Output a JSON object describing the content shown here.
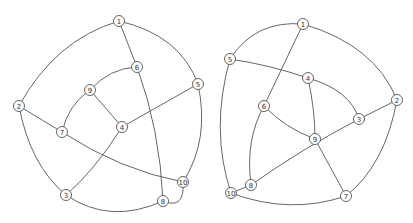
{
  "graphs": [
    {
      "name": "left-graph",
      "nodes": [
        {
          "id": "1",
          "x": 119,
          "y": 21
        },
        {
          "id": "2",
          "x": 19,
          "y": 106
        },
        {
          "id": "3",
          "x": 66,
          "y": 195
        },
        {
          "id": "4",
          "x": 122,
          "y": 127
        },
        {
          "id": "5",
          "x": 198,
          "y": 84
        },
        {
          "id": "6",
          "x": 137,
          "y": 67
        },
        {
          "id": "7",
          "x": 62,
          "y": 132
        },
        {
          "id": "8",
          "x": 163,
          "y": 201
        },
        {
          "id": "9",
          "x": 90,
          "y": 90
        },
        {
          "id": "10",
          "x": 183,
          "y": 182
        }
      ],
      "edges": [
        {
          "d": "M119,21 Q55,40 19,106"
        },
        {
          "d": "M119,21 Q180,35 198,84"
        },
        {
          "d": "M119,21 L137,67"
        },
        {
          "d": "M137,67 Q110,68 90,90"
        },
        {
          "d": "M137,67 Q160,130 163,201"
        },
        {
          "d": "M90,90 L122,127"
        },
        {
          "d": "M90,90 Q68,105 62,132"
        },
        {
          "d": "M122,127 L198,84"
        },
        {
          "d": "M122,127 Q95,170 66,195"
        },
        {
          "d": "M19,106 L62,132"
        },
        {
          "d": "M19,106 Q30,165 66,195"
        },
        {
          "d": "M62,132 Q120,170 183,182"
        },
        {
          "d": "M198,84 Q210,140 183,182"
        },
        {
          "d": "M66,195 Q110,225 163,201"
        },
        {
          "d": "M163,201 Q185,210 183,182"
        }
      ]
    },
    {
      "name": "right-graph",
      "nodes": [
        {
          "id": "1",
          "x": 303,
          "y": 24
        },
        {
          "id": "2",
          "x": 397,
          "y": 100
        },
        {
          "id": "3",
          "x": 359,
          "y": 119
        },
        {
          "id": "4",
          "x": 308,
          "y": 78
        },
        {
          "id": "5",
          "x": 230,
          "y": 59
        },
        {
          "id": "6",
          "x": 264,
          "y": 106
        },
        {
          "id": "7",
          "x": 346,
          "y": 196
        },
        {
          "id": "8",
          "x": 251,
          "y": 185
        },
        {
          "id": "9",
          "x": 315,
          "y": 139
        },
        {
          "id": "10",
          "x": 231,
          "y": 193
        }
      ],
      "edges": [
        {
          "d": "M303,24 Q255,20 230,59"
        },
        {
          "d": "M303,24 Q375,45 397,100"
        },
        {
          "d": "M303,24 L264,106"
        },
        {
          "d": "M230,59 Q270,65 308,78"
        },
        {
          "d": "M230,59 Q210,130 231,193"
        },
        {
          "d": "M308,78 Q350,90 359,119"
        },
        {
          "d": "M308,78 Q315,110 315,139"
        },
        {
          "d": "M264,106 Q285,128 315,139"
        },
        {
          "d": "M264,106 Q245,140 251,185"
        },
        {
          "d": "M359,119 L397,100"
        },
        {
          "d": "M359,119 Q300,150 251,185"
        },
        {
          "d": "M315,139 L346,196"
        },
        {
          "d": "M397,100 Q385,165 346,196"
        },
        {
          "d": "M251,185 L231,193"
        },
        {
          "d": "M231,193 Q290,215 346,196"
        }
      ]
    }
  ]
}
